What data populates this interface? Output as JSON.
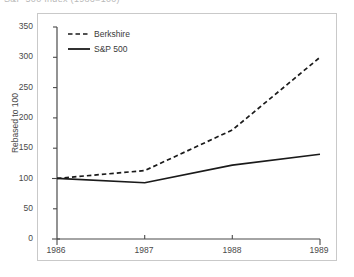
{
  "title": {
    "text": "S&P 500 Index (1986=100)",
    "cropped": true
  },
  "chart_data": {
    "type": "line",
    "title": "S&P 500 Index (1986=100)",
    "xlabel": "",
    "ylabel": "Rebased to 100",
    "x": [
      1986,
      1987,
      1988,
      1989
    ],
    "categories": [
      "1986",
      "1987",
      "1988",
      "1989"
    ],
    "xlim": [
      1986,
      1989
    ],
    "ylim": [
      0,
      350
    ],
    "yticks": [
      0,
      50,
      100,
      150,
      200,
      250,
      300,
      350
    ],
    "ytick_labels": [
      "0",
      "50",
      "100",
      "150",
      "200",
      "250",
      "300",
      "350"
    ],
    "xticks": [
      1986,
      1987,
      1988,
      1989
    ],
    "xtick_labels": [
      "1986",
      "1987",
      "1988",
      "1989"
    ],
    "grid": false,
    "legend_position": "top-left",
    "series": [
      {
        "name": "Berkshire",
        "style": "dashed",
        "color": "#1a1a1a",
        "values": [
          100,
          113,
          180,
          300
        ]
      },
      {
        "name": "S&P 500",
        "style": "solid",
        "color": "#1a1a1a",
        "values": [
          100,
          93,
          122,
          140
        ]
      }
    ]
  },
  "legend": {
    "items": [
      {
        "label": "Berkshire",
        "style": "dashed"
      },
      {
        "label": "S&P 500",
        "style": "solid"
      }
    ]
  },
  "axes": {
    "y_title": "Rebased to 100",
    "y_ticks": [
      "350",
      "300",
      "250",
      "200",
      "150",
      "100",
      "50",
      "0"
    ],
    "x_ticks": [
      "1986",
      "1987",
      "1988",
      "1989"
    ]
  },
  "colors": {
    "ink": "#1a1a1a",
    "axis": "#4a4a4a",
    "frame": "#c9c9c9",
    "background": "#ffffff"
  }
}
